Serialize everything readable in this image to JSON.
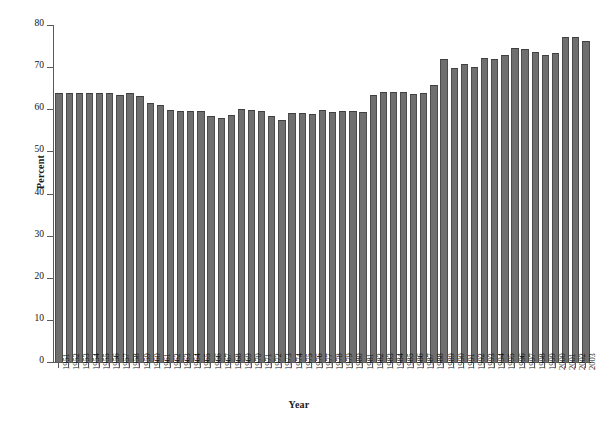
{
  "chart_data": {
    "type": "bar",
    "title": "",
    "subtitle": "",
    "xlabel": "Year",
    "ylabel": "Percent",
    "ylim": [
      0,
      80
    ],
    "yticks": [
      0,
      10,
      20,
      30,
      40,
      50,
      60,
      70,
      80
    ],
    "grid": false,
    "legend": null,
    "bar_color": "#6f6f6f",
    "bar_edge_color": "#4c4c4c",
    "axis_color": "#5a5a5a",
    "categories": [
      "1951",
      "1952",
      "1953",
      "1954",
      "1955",
      "1956",
      "1957",
      "1958",
      "1959",
      "1960",
      "1961",
      "1962",
      "1963",
      "1964",
      "1965",
      "1966",
      "1967",
      "1968",
      "1969",
      "1970",
      "1971",
      "1972",
      "1973",
      "1974",
      "1975",
      "1976",
      "1977",
      "1978",
      "1979",
      "1980",
      "1981",
      "1982",
      "1983",
      "1984",
      "1985",
      "1986",
      "1987",
      "1988",
      "1989",
      "1990",
      "1991",
      "1992",
      "1993",
      "1994",
      "1995",
      "1996",
      "1997",
      "1998",
      "1999",
      "2000",
      "2001",
      "2002",
      "2003"
    ],
    "values": [
      63.9,
      63.8,
      63.8,
      63.8,
      63.8,
      63.9,
      63.5,
      63.9,
      63.1,
      61.4,
      60.9,
      59.8,
      59.6,
      59.5,
      59.7,
      58.4,
      58.0,
      58.7,
      60.0,
      59.8,
      59.5,
      58.3,
      57.5,
      59.2,
      59.2,
      58.8,
      59.9,
      59.4,
      59.6,
      59.5,
      59.4,
      63.5,
      64.1,
      64.0,
      64.0,
      63.6,
      63.8,
      65.8,
      71.9,
      69.9,
      70.7,
      70.1,
      72.1,
      71.9,
      73.0,
      74.6,
      74.4,
      73.5,
      73.0,
      73.4,
      77.1,
      77.2,
      76.1
    ]
  }
}
